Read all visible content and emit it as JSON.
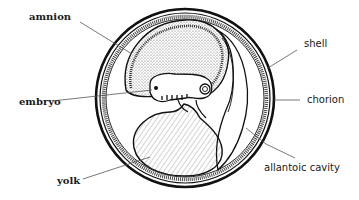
{
  "diagram": {
    "labels": {
      "amnion": "amnion",
      "embryo": "embryo",
      "yolk": "yolk",
      "shell": "shell",
      "chorion": "chorion",
      "allantoic_cavity": "allantoic cavity"
    },
    "colors": {
      "ink": "#111111",
      "background": "#ffffff",
      "stipple": "#555555"
    }
  }
}
